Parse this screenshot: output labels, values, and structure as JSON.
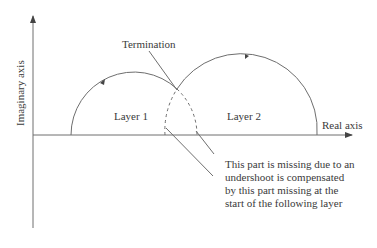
{
  "diagram": {
    "axes": {
      "x_label": "Real axis",
      "y_label": "Imaginary axis"
    },
    "layers": [
      {
        "label": "Layer 1"
      },
      {
        "label": "Layer 2"
      }
    ],
    "annotations": {
      "termination": "Termination",
      "note_lines": [
        "This part is missing due to an",
        "undershoot is compensated",
        "by this part missing at the",
        "start of the following layer"
      ]
    },
    "colors": {
      "line": "#6e6e6e",
      "text": "#3a3a3a",
      "background": "#ffffff"
    }
  }
}
